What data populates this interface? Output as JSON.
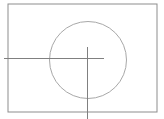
{
  "canvas": {
    "width": 164,
    "height": 119,
    "background_color": "#ffffff",
    "title": "Technical line drawing"
  },
  "chart_data": {
    "type": "diagram",
    "title": "",
    "shapes": [
      {
        "name": "frame-rectangle",
        "type": "rect",
        "x": 8,
        "y": 4,
        "width": 149,
        "height": 108,
        "stroke": "#8d8d8d",
        "stroke_width": 1,
        "fill": "none"
      },
      {
        "name": "circle",
        "type": "circle",
        "cx": 88,
        "cy": 60,
        "r": 38.5,
        "stroke": "#a8a8a8",
        "stroke_width": 1,
        "fill": "none"
      },
      {
        "name": "horizontal-centerline",
        "type": "line",
        "x1": 4,
        "y1": 58.5,
        "x2": 104,
        "y2": 58.5,
        "stroke": "#808080",
        "stroke_width": 1
      },
      {
        "name": "vertical-centerline",
        "type": "line",
        "x1": 87.5,
        "y1": 47,
        "x2": 87.5,
        "y2": 119,
        "stroke": "#808080",
        "stroke_width": 1
      }
    ],
    "colors": {
      "frame_stroke": "#8d8d8d",
      "circle_stroke": "#a8a8a8",
      "centerline_stroke": "#808080",
      "background": "#ffffff"
    }
  }
}
